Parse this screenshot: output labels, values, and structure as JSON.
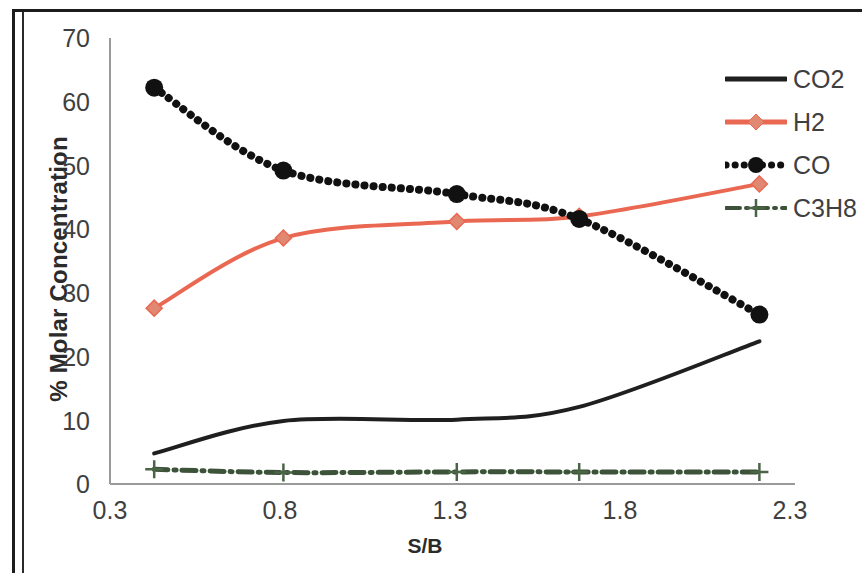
{
  "chart_data": {
    "type": "line",
    "title": "",
    "xlabel": "S/B",
    "ylabel": "% Molar Concentration",
    "xlim": [
      0.3,
      2.3
    ],
    "ylim": [
      0,
      70
    ],
    "xticks": [
      "0.3",
      "0.8",
      "1.3",
      "1.8",
      "2.3"
    ],
    "yticks": [
      "0",
      "10",
      "20",
      "30",
      "40",
      "50",
      "60",
      "70"
    ],
    "grid": false,
    "legend_position": "right",
    "x": [
      0.43,
      0.81,
      1.32,
      1.68,
      2.21
    ],
    "series": [
      {
        "name": "CO2",
        "color": "#1f1f1f",
        "style": "solid",
        "marker": "none",
        "values": [
          4.8,
          9.9,
          10.1,
          12.1,
          22.4
        ]
      },
      {
        "name": "H2",
        "color": "#ea6852",
        "style": "solid",
        "marker": "diamond",
        "values": [
          27.6,
          38.6,
          41.2,
          42.0,
          47.1
        ]
      },
      {
        "name": "CO",
        "color": "#111111",
        "style": "dotted",
        "marker": "circle",
        "values": [
          62.2,
          49.2,
          45.5,
          41.6,
          26.6
        ]
      },
      {
        "name": "C3H8",
        "color": "#3c5239",
        "style": "dashdot",
        "marker": "plus",
        "values": [
          2.3,
          1.8,
          1.9,
          1.9,
          1.9
        ]
      }
    ]
  },
  "axis": {
    "ylabel": "% Molar Concentration",
    "xlabel": "S/B",
    "yticks": [
      {
        "label": "70",
        "top": 24
      },
      {
        "label": "60",
        "top": 88
      },
      {
        "label": "50",
        "top": 152
      },
      {
        "label": "40",
        "top": 215
      },
      {
        "label": "30",
        "top": 279
      },
      {
        "label": "20",
        "top": 343
      },
      {
        "label": "10",
        "top": 407
      },
      {
        "label": "0",
        "top": 470
      }
    ],
    "xticks": [
      {
        "label": "0.3",
        "left": 70
      },
      {
        "label": "0.8",
        "left": 240
      },
      {
        "label": "1.3",
        "left": 410
      },
      {
        "label": "1.8",
        "left": 580
      },
      {
        "label": "2.3",
        "left": 750
      }
    ]
  },
  "legend": {
    "items": [
      {
        "label": "CO2",
        "top": 62
      },
      {
        "label": "H2",
        "top": 105
      },
      {
        "label": "CO",
        "top": 148
      },
      {
        "label": "C3H8",
        "top": 191
      }
    ]
  }
}
